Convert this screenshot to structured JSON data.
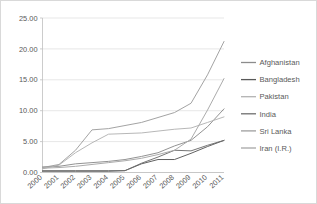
{
  "chart_data": {
    "type": "line",
    "title": "",
    "subtitle": "",
    "xlabel": "",
    "ylabel": "",
    "categories": [
      "2000",
      "2001",
      "2002",
      "2003",
      "2004",
      "2005",
      "2006",
      "2007",
      "2008",
      "2009",
      "2010",
      "2011"
    ],
    "x_tick_labels": [
      "2000",
      "2001",
      "2002",
      "2003",
      "2004",
      "2005",
      "2006",
      "2007",
      "2008",
      "2009",
      "2010",
      "2011"
    ],
    "y_tick_labels": [
      "0.00",
      "5.00",
      "10.00",
      "15.00",
      "20.00",
      "25.00"
    ],
    "y_tick_values": [
      0,
      5,
      10,
      15,
      20,
      25
    ],
    "ylim": [
      0,
      25
    ],
    "grid": "horizontal",
    "legend_position": "right",
    "series": [
      {
        "name": "Afghanistan",
        "color": "#8c8c8c",
        "values": [
          0.9,
          1.0,
          1.4,
          1.6,
          1.8,
          2.1,
          2.6,
          3.2,
          4.3,
          5.2,
          7.4,
          10.3
        ]
      },
      {
        "name": "Bangladesh",
        "color": "#595959",
        "values": [
          0.2,
          0.2,
          0.2,
          0.2,
          0.2,
          0.3,
          1.4,
          2.1,
          2.1,
          3.1,
          4.2,
          5.2
        ]
      },
      {
        "name": "Pakistan",
        "color": "#b3b3b3",
        "values": [
          0.6,
          1.2,
          3.2,
          4.8,
          6.2,
          6.3,
          6.4,
          6.7,
          7.0,
          7.2,
          8.1,
          9.0
        ]
      },
      {
        "name": "India",
        "color": "#6e6e6e",
        "values": [
          0.3,
          0.3,
          0.3,
          0.3,
          0.3,
          0.3,
          1.5,
          2.5,
          3.6,
          3.5,
          4.4,
          5.2
        ]
      },
      {
        "name": "Sri Lanka",
        "color": "#9e9e9e",
        "values": [
          0.8,
          1.3,
          3.6,
          6.9,
          7.1,
          7.6,
          8.1,
          8.9,
          9.7,
          11.2,
          15.8,
          21.2
        ]
      },
      {
        "name": "Iran (I.R.)",
        "color": "#a6a6a6",
        "values": [
          0.7,
          0.8,
          1.0,
          1.3,
          1.6,
          1.9,
          2.3,
          2.9,
          3.6,
          5.4,
          10.1,
          15.2
        ]
      }
    ]
  },
  "legend": {
    "entries": [
      {
        "label": "Afghanistan"
      },
      {
        "label": "Bangladesh"
      },
      {
        "label": "Pakistan"
      },
      {
        "label": "India"
      },
      {
        "label": "Sri Lanka"
      },
      {
        "label": "Iran (I.R.)"
      }
    ]
  },
  "colors": {
    "grid": "#dcdcdc",
    "axis": "#bfbfbf",
    "text": "#595959",
    "background": "#ffffff",
    "border": "#d9d9d9"
  }
}
